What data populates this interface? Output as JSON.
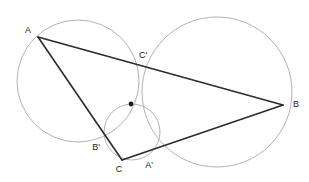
{
  "figure": {
    "background_color": "#ffffff",
    "width": 309,
    "height": 182,
    "circle_color": "#a9a9a9",
    "line_color": "#2b2b2b",
    "label_color": "#1a1a1a"
  },
  "points": {
    "A": {
      "label": "A",
      "x": 38,
      "y": 37,
      "label_x": 28,
      "label_y": 31
    },
    "B": {
      "label": "B",
      "x": 283,
      "y": 105,
      "label_x": 293,
      "label_y": 105
    },
    "C": {
      "label": "C",
      "x": 122,
      "y": 160,
      "label_x": 119,
      "label_y": 170
    },
    "A_prime": {
      "label": "A'",
      "x": 152,
      "y": 157,
      "label_x": 149,
      "label_y": 166
    },
    "B_prime": {
      "label": "B'",
      "x": 107,
      "y": 142,
      "label_x": 96,
      "label_y": 148
    },
    "C_prime": {
      "label": "C'",
      "x": 135,
      "y": 62,
      "label_x": 143,
      "label_y": 56
    },
    "center": {
      "label": "",
      "x": 131,
      "y": 104,
      "label_x": 131,
      "label_y": 104
    }
  },
  "circles": [
    {
      "name": "circle-left",
      "cx": 78,
      "cy": 81,
      "r": 61
    },
    {
      "name": "circle-right",
      "cx": 217,
      "cy": 92,
      "r": 75
    },
    {
      "name": "circle-small",
      "cx": 132,
      "cy": 132,
      "r": 28
    }
  ],
  "edges": [
    {
      "name": "edge-AB",
      "from": "A",
      "to": "B"
    },
    {
      "name": "edge-AC",
      "from": "A",
      "to": "C"
    },
    {
      "name": "edge-CB",
      "from": "C",
      "to": "B"
    }
  ],
  "chart_data": {
    "type": "scatter",
    "xlabel": "",
    "ylabel": "",
    "xlim": [
      0,
      309
    ],
    "ylim": [
      0,
      182
    ],
    "grid": false,
    "legend": "none",
    "annotations": [
      "A",
      "B",
      "C",
      "A'",
      "B'",
      "C'"
    ],
    "series": [
      {
        "name": "triangle-vertices",
        "x": [
          38,
          283,
          122
        ],
        "y": [
          37,
          105,
          160
        ],
        "labels": [
          "A",
          "B",
          "C"
        ]
      },
      {
        "name": "marked-points",
        "x": [
          135,
          152,
          107,
          131
        ],
        "y": [
          62,
          157,
          142,
          104
        ],
        "labels": [
          "C'",
          "A'",
          "B'",
          "center"
        ]
      }
    ],
    "circles": [
      {
        "cx": 78,
        "cy": 81,
        "r": 61
      },
      {
        "cx": 217,
        "cy": 92,
        "r": 75
      },
      {
        "cx": 132,
        "cy": 132,
        "r": 28
      }
    ]
  }
}
